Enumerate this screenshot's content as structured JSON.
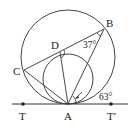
{
  "diagram": {
    "type": "geometry",
    "points": {
      "A": "A",
      "B": "B",
      "C": "C",
      "D": "D",
      "T": "T",
      "T_prime": "T′"
    },
    "angles": {
      "angle_ABC": "37°",
      "angle_BAT_prime": "63°"
    },
    "colors": {
      "stroke": "#333333",
      "text": "#222222",
      "background": "#ffffff"
    }
  }
}
